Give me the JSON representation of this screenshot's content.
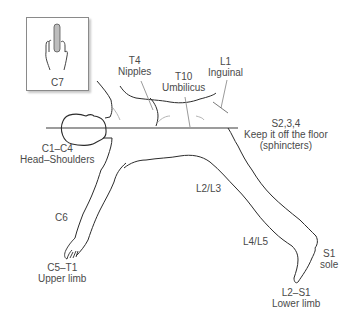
{
  "inset": {
    "label": "C7",
    "icon": "hand-middle-finger-icon"
  },
  "labels": {
    "t4": {
      "level": "T4",
      "region": "Nipples"
    },
    "t10": {
      "level": "T10",
      "region": "Umbilicus"
    },
    "l1": {
      "level": "L1",
      "region": "Inguinal"
    },
    "s234": {
      "level": "S2,3,4",
      "region": "Keep it off the floor",
      "note": "(sphincters)"
    },
    "c1c4": {
      "level": "C1–C4",
      "region": "Head–Shoulders"
    },
    "c6": {
      "level": "C6"
    },
    "c5t1": {
      "level": "C5–T1",
      "region": "Upper limb"
    },
    "l2l3": {
      "level": "L2/L3"
    },
    "l4l5": {
      "level": "L4/L5"
    },
    "s1": {
      "level": "S1",
      "region": "sole"
    },
    "l2s1": {
      "level": "L2–S1",
      "region": "Lower limb"
    }
  },
  "colors": {
    "outline": "#2b2b2b",
    "pointer": "#8f8f8f",
    "text": "#4a4a4a"
  }
}
